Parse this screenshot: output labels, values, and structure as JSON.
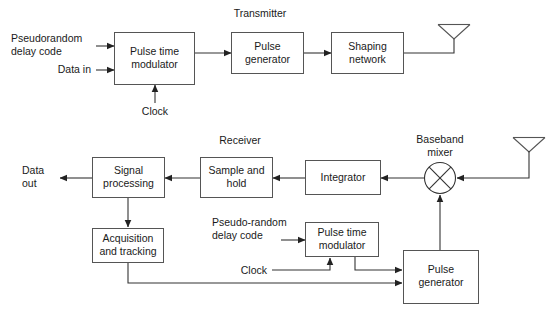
{
  "diagram": {
    "background_color": "#ffffff",
    "line_color": "#333333",
    "box_stroke_color": "#555555",
    "text_color": "#1a1a1a",
    "sections": {
      "transmitter_label": "Transmitter",
      "receiver_label": "Receiver",
      "baseband_mixer_label": "Baseband\nmixer",
      "baseband_mixer_line1": "Baseband",
      "baseband_mixer_line2": "mixer"
    },
    "transmitter": {
      "inputs": {
        "pseudorandom_line1": "Pseudorandom",
        "pseudorandom_line2": "delay code",
        "data_in": "Data in",
        "clock": "Clock"
      },
      "blocks": [
        {
          "id": "tx-pulse-time-modulator",
          "line1": "Pulse time",
          "line2": "modulator"
        },
        {
          "id": "tx-pulse-generator",
          "line1": "Pulse",
          "line2": "generator"
        },
        {
          "id": "tx-shaping-network",
          "line1": "Shaping",
          "line2": "network"
        }
      ],
      "antenna": "transmit-antenna"
    },
    "receiver": {
      "outputs": {
        "data_out_line1": "Data",
        "data_out_line2": "out"
      },
      "inputs": {
        "pseudorandom_line1": "Pseudo-random",
        "pseudorandom_line2": "delay code",
        "clock": "Clock"
      },
      "blocks": [
        {
          "id": "rx-signal-processing",
          "line1": "Signal",
          "line2": "processing"
        },
        {
          "id": "rx-sample-and-hold",
          "line1": "Sample and",
          "line2": "hold"
        },
        {
          "id": "rx-integrator",
          "line1": "Integrator",
          "line2": ""
        },
        {
          "id": "rx-acquisition-and-tracking",
          "line1": "Acquisition",
          "line2": "and tracking"
        },
        {
          "id": "rx-pulse-time-modulator",
          "line1": "Pulse time",
          "line2": "modulator"
        },
        {
          "id": "rx-pulse-generator",
          "line1": "Pulse",
          "line2": "generator"
        }
      ],
      "antenna": "receive-antenna",
      "mixer": "baseband-mixer"
    }
  }
}
